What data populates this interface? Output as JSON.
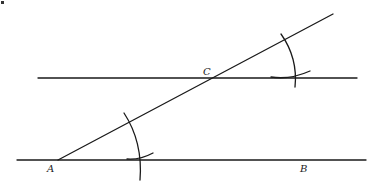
{
  "diagram": {
    "labels": {
      "A": "A",
      "B": "B",
      "C": "C"
    },
    "colors": {
      "ink": "#1a1a1a",
      "background": "#ffffff"
    },
    "elements": {
      "baseline_AB": {
        "x1": 17,
        "y1": 160,
        "x2": 366,
        "y2": 160
      },
      "parallel_line_through_C": {
        "x1": 38,
        "y1": 78,
        "x2": 357,
        "y2": 78
      },
      "transversal_AC": {
        "x1": 58,
        "y1": 160,
        "x2": 333,
        "y2": 14
      },
      "arc_at_A": "intersects transversal and baseline",
      "arc_at_C": "copied arc intersecting transversal and parallel line"
    }
  }
}
